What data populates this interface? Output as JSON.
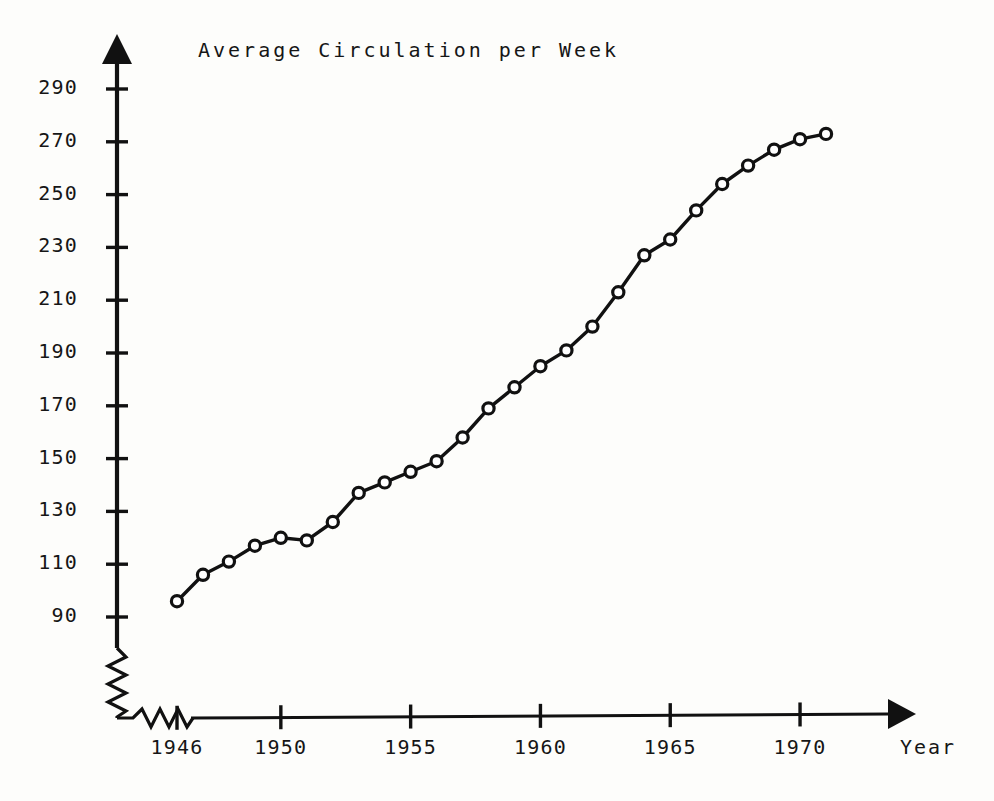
{
  "chart_data": {
    "type": "line",
    "title": "Average Circulation per Week",
    "xlabel": "Year",
    "ylabel": "",
    "xlim": [
      1945,
      1972
    ],
    "ylim": [
      85,
      300
    ],
    "grid": false,
    "legend": "none",
    "axis_break_x": true,
    "axis_break_y": true,
    "marker": "open-circle",
    "x": [
      1946,
      1947,
      1948,
      1949,
      1950,
      1951,
      1952,
      1953,
      1954,
      1955,
      1956,
      1957,
      1958,
      1959,
      1960,
      1961,
      1962,
      1963,
      1964,
      1965,
      1966,
      1967,
      1968,
      1969,
      1970,
      1971
    ],
    "values": [
      96,
      106,
      111,
      117,
      120,
      119,
      126,
      137,
      141,
      145,
      149,
      158,
      169,
      177,
      185,
      191,
      200,
      213,
      227,
      233,
      244,
      254,
      261,
      267,
      271,
      273
    ],
    "yticks": [
      290,
      270,
      250,
      230,
      210,
      190,
      170,
      150,
      130,
      110,
      90
    ],
    "ytick_labels": [
      "290",
      "270",
      "250",
      "230",
      "210",
      "190",
      "170",
      "150",
      "130",
      "110",
      "90"
    ],
    "xticks": [
      1946,
      1950,
      1955,
      1960,
      1965,
      1970
    ],
    "xtick_labels": [
      "1946",
      "1950",
      "1955",
      "1960",
      "1965",
      "1970"
    ],
    "line_color": "#111111",
    "marker_fill": "#ffffff",
    "axis_color": "#111111"
  },
  "chart": {
    "title": "Average Circulation per Week",
    "x_axis_title": "Year"
  }
}
